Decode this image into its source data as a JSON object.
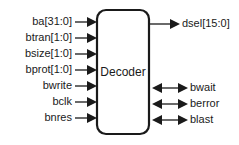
{
  "diagram": {
    "type": "block-diagram",
    "block": {
      "label": "Decoder",
      "x": 97,
      "y": 10,
      "width": 52,
      "height": 124,
      "corner_radius": 9,
      "stroke_color": "#1a1a1a",
      "stroke_width": 2.2,
      "fill_color": "#ffffff"
    },
    "inputs": [
      {
        "label": "ba[31:0]",
        "y": 22,
        "label_right_x": 72,
        "line_start_x": 75,
        "arrow_tip_x": 97
      },
      {
        "label": "btran[1:0]",
        "y": 38,
        "label_right_x": 72,
        "line_start_x": 75,
        "arrow_tip_x": 97
      },
      {
        "label": "bsize[1:0]",
        "y": 54,
        "label_right_x": 72,
        "line_start_x": 75,
        "arrow_tip_x": 97
      },
      {
        "label": "bprot[1:0]",
        "y": 70,
        "label_right_x": 72,
        "line_start_x": 75,
        "arrow_tip_x": 97
      },
      {
        "label": "bwrite",
        "y": 86,
        "label_right_x": 72,
        "line_start_x": 75,
        "arrow_tip_x": 97
      },
      {
        "label": "bclk",
        "y": 102,
        "label_right_x": 72,
        "line_start_x": 75,
        "arrow_tip_x": 97
      },
      {
        "label": "bnres",
        "y": 118,
        "label_right_x": 72,
        "line_start_x": 75,
        "arrow_tip_x": 97
      }
    ],
    "outputs": [
      {
        "label": "dsel[15:0]",
        "y": 24,
        "label_left_x": 182,
        "line_start_x": 149,
        "arrow_tip_x": 180
      }
    ],
    "bidirectional": [
      {
        "label": "bwait",
        "y": 88,
        "label_left_x": 190,
        "line_left_x": 152,
        "line_right_x": 188
      },
      {
        "label": "berror",
        "y": 104,
        "label_left_x": 190,
        "line_left_x": 152,
        "line_right_x": 188
      },
      {
        "label": "blast",
        "y": 120,
        "label_left_x": 190,
        "line_left_x": 152,
        "line_right_x": 188
      }
    ],
    "colors": {
      "stroke": "#1a1a1a",
      "text": "#1a1a1a",
      "background": "#ffffff"
    }
  }
}
